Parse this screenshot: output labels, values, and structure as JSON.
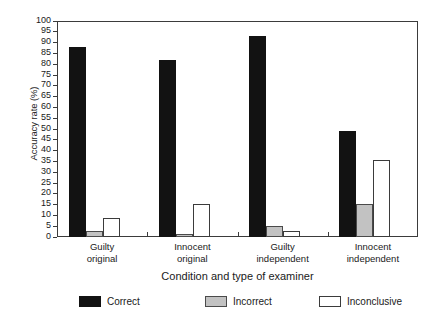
{
  "chart_data": {
    "type": "bar",
    "title": "",
    "xlabel": "Condition and type of examiner",
    "ylabel": "Accuracy rate (%)",
    "categories": [
      "Guilty original",
      "Innocent original",
      "Guilty independent",
      "Innocent independent"
    ],
    "category_lines": [
      [
        "Guilty",
        "original"
      ],
      [
        "Innocent",
        "original"
      ],
      [
        "Guilty",
        "independent"
      ],
      [
        "Innocent",
        "independent"
      ]
    ],
    "series": [
      {
        "name": "Correct",
        "color": "#121212",
        "values": [
          88,
          82,
          93,
          49
        ]
      },
      {
        "name": "Incorrect",
        "color": "#c2c2c2",
        "values": [
          3,
          1.5,
          5,
          15.5
        ]
      },
      {
        "name": "Inconclusive",
        "color": "#ffffff",
        "values": [
          9,
          15.5,
          3,
          35.5
        ]
      }
    ],
    "ylim": [
      0,
      100
    ],
    "ytick_step": 5,
    "yticks": [
      0,
      5,
      10,
      15,
      20,
      25,
      30,
      35,
      40,
      45,
      50,
      55,
      60,
      65,
      70,
      75,
      80,
      85,
      90,
      95,
      100
    ],
    "ytick_labels": [
      "0",
      "5",
      "10",
      "15",
      "20",
      "25",
      "30",
      "35",
      "40",
      "45",
      "50",
      "55",
      "60",
      "65",
      "70",
      "75",
      "80",
      "85",
      "90",
      "95",
      "100"
    ],
    "grid": false,
    "legend_position": "bottom",
    "legend_entries": [
      "Correct",
      "Incorrect",
      "Inconclusive"
    ]
  }
}
